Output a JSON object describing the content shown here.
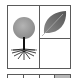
{
  "colors": {
    "border": "#5a5a5a",
    "canopy": "#9a9a9a",
    "trunk": "#111111",
    "leaf": "#6f6f6f",
    "shaded_cell": "#b8b8b8",
    "background": "#ffffff"
  },
  "panel": {
    "cells": [
      {
        "position": "left",
        "icon": "tree-icon"
      },
      {
        "position": "top-right",
        "icon": "leaf-icon"
      },
      {
        "position": "bottom-right",
        "icon": null
      }
    ]
  },
  "row2": {
    "cells": [
      {
        "shaded": false
      },
      {
        "shaded": false
      },
      {
        "shaded": false
      },
      {
        "shaded": true
      }
    ]
  }
}
